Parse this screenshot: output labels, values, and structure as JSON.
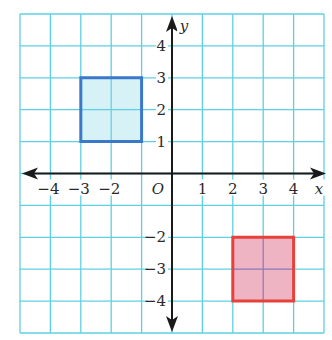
{
  "diagram": {
    "type": "coordinate-plane",
    "grid": {
      "xmin": -5,
      "xmax": 5,
      "ymin": -5,
      "ymax": 5,
      "color": "#5fd0e3"
    },
    "axes": {
      "x_label": "x",
      "y_label": "y",
      "origin_label": "O",
      "color": "#1a1a1a",
      "x_ticks": [
        {
          "value": -4,
          "label": "−4"
        },
        {
          "value": -3,
          "label": "−3"
        },
        {
          "value": -2,
          "label": "−2"
        },
        {
          "value": 1,
          "label": "1"
        },
        {
          "value": 2,
          "label": "2"
        },
        {
          "value": 3,
          "label": "3"
        },
        {
          "value": 4,
          "label": "4"
        }
      ],
      "y_ticks": [
        {
          "value": 4,
          "label": "4"
        },
        {
          "value": 3,
          "label": "3"
        },
        {
          "value": 2,
          "label": "2"
        },
        {
          "value": 1,
          "label": "1"
        },
        {
          "value": -2,
          "label": "−2"
        },
        {
          "value": -3,
          "label": "−3"
        },
        {
          "value": -4,
          "label": "−4"
        }
      ]
    },
    "shapes": [
      {
        "name": "blue-square",
        "vertices": [
          [
            -3,
            3
          ],
          [
            -1,
            3
          ],
          [
            -1,
            1
          ],
          [
            -3,
            1
          ]
        ],
        "stroke": "#3a78c9",
        "fill": "#d6f2f7"
      },
      {
        "name": "red-square",
        "vertices": [
          [
            2,
            -2
          ],
          [
            4,
            -2
          ],
          [
            4,
            -4
          ],
          [
            2,
            -4
          ]
        ],
        "stroke": "#e8403a",
        "fill": "#eeb4c3"
      }
    ]
  }
}
